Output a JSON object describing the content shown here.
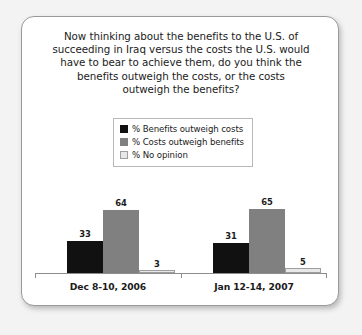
{
  "chart_data": {
    "type": "bar",
    "title_lines": [
      "Now thinking about the benefits to the U.S. of",
      "succeeding in Iraq versus the costs the U.S. would",
      "have to bear to achieve them, do you think the",
      "benefits outweigh the costs, or the costs",
      "outweigh the benefits?"
    ],
    "categories": [
      "Dec 8-10, 2006",
      "Jan 12-14, 2007"
    ],
    "series": [
      {
        "name": "% Benefits outweigh costs",
        "color": "#111111",
        "values": [
          33,
          31
        ]
      },
      {
        "name": "% Costs outweigh benefits",
        "color": "#808080",
        "values": [
          64,
          65
        ]
      },
      {
        "name": "% No opinion",
        "color": "#e8e8e8",
        "values": [
          3,
          5
        ]
      }
    ],
    "xlabel": "",
    "ylabel": "",
    "ylim": [
      0,
      100
    ],
    "grid": false,
    "legend_position": "top-center",
    "legend_entries": [
      "% Benefits outweigh costs",
      "% Costs outweigh benefits",
      "% No opinion"
    ]
  },
  "colors": {
    "card_background": "#ffffff",
    "card_border": "#9a9a9a",
    "page_background": "#f3f3f3",
    "axis": "#8d8d8d",
    "text": "#1b1b1b",
    "legend_border": "#b8b8b8",
    "series_1": "#111111",
    "series_2": "#808080",
    "series_3": "#e8e8e8",
    "series_3_border": "#9e9e9e"
  }
}
